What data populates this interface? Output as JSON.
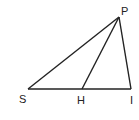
{
  "diagram": {
    "type": "triangle-geometry",
    "stroke_color": "#222222",
    "points": [
      {
        "id": "P",
        "label": "P",
        "x": 119,
        "y": 17
      },
      {
        "id": "S",
        "label": "S",
        "x": 28,
        "y": 89
      },
      {
        "id": "H",
        "label": "H",
        "x": 82,
        "y": 89
      },
      {
        "id": "I",
        "label": "I",
        "x": 131,
        "y": 89
      }
    ],
    "segments": [
      [
        "S",
        "P"
      ],
      [
        "P",
        "I"
      ],
      [
        "S",
        "I"
      ],
      [
        "P",
        "H"
      ]
    ],
    "labels": {
      "P": "P",
      "S": "S",
      "H": "H",
      "I": "I"
    }
  }
}
